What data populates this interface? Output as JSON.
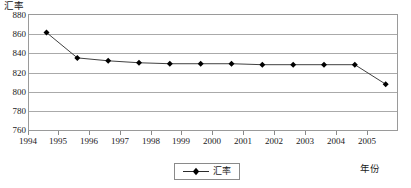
{
  "chart_data": {
    "type": "line",
    "title": "",
    "ylabel": "汇率",
    "xlabel": "年份",
    "legend": [
      "汇率"
    ],
    "legend_position": "bottom-center",
    "grid": true,
    "ylim": [
      760,
      880
    ],
    "ytick_step": 20,
    "yticks": [
      "880",
      "860",
      "840",
      "820",
      "800",
      "780",
      "760"
    ],
    "ytick_values": [
      880,
      860,
      840,
      820,
      800,
      780,
      760
    ],
    "xticks": [
      "1994",
      "1995",
      "1996",
      "1997",
      "1998",
      "1999",
      "2000",
      "2001",
      "2002",
      "2003",
      "2004",
      "2005"
    ],
    "xtick_values": [
      1994,
      1995,
      1996,
      1997,
      1998,
      1999,
      2000,
      2001,
      2002,
      2003,
      2004,
      2005
    ],
    "xlim": [
      1994,
      2006
    ],
    "series": [
      {
        "name": "汇率",
        "marker": "diamond",
        "color": "#000000",
        "x": [
          1994.6,
          1995.6,
          1996.6,
          1997.6,
          1998.6,
          1999.6,
          2000.6,
          2001.6,
          2002.6,
          2003.6,
          2004.6,
          2005.6
        ],
        "values": [
          861,
          835,
          832,
          830,
          829,
          829,
          829,
          828,
          828,
          828,
          828,
          808
        ]
      }
    ]
  },
  "axis": {
    "y_title": "汇率",
    "x_title": "年份"
  },
  "legend": {
    "items": [
      {
        "label": "汇率",
        "color": "#000000"
      }
    ]
  }
}
